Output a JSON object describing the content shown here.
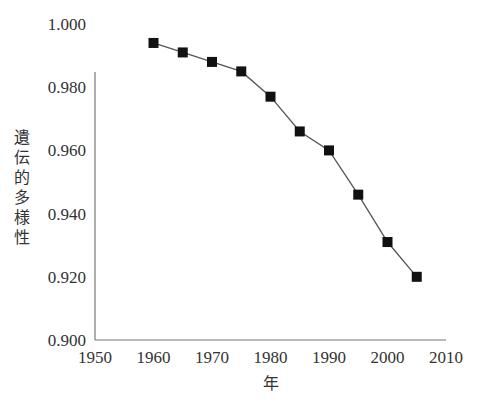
{
  "chart_data": {
    "type": "line",
    "title": "",
    "xlabel": "年",
    "ylabel": "遺伝的多様性",
    "x": [
      1960,
      1965,
      1970,
      1975,
      1980,
      1985,
      1990,
      1995,
      2000,
      2005
    ],
    "series": [
      {
        "name": "遺伝的多様性",
        "values": [
          0.994,
          0.991,
          0.988,
          0.985,
          0.977,
          0.966,
          0.96,
          0.946,
          0.931,
          0.92
        ],
        "marker": "square",
        "color": "#111111"
      }
    ],
    "xlim": [
      1950,
      2010
    ],
    "ylim": [
      0.9,
      1.0
    ],
    "xticks": [
      "1950",
      "1960",
      "1970",
      "1980",
      "1990",
      "2000",
      "2010"
    ],
    "yticks": [
      "0.900",
      "0.920",
      "0.940",
      "0.960",
      "0.980",
      "1.000"
    ],
    "grid": false,
    "legend": "none"
  }
}
